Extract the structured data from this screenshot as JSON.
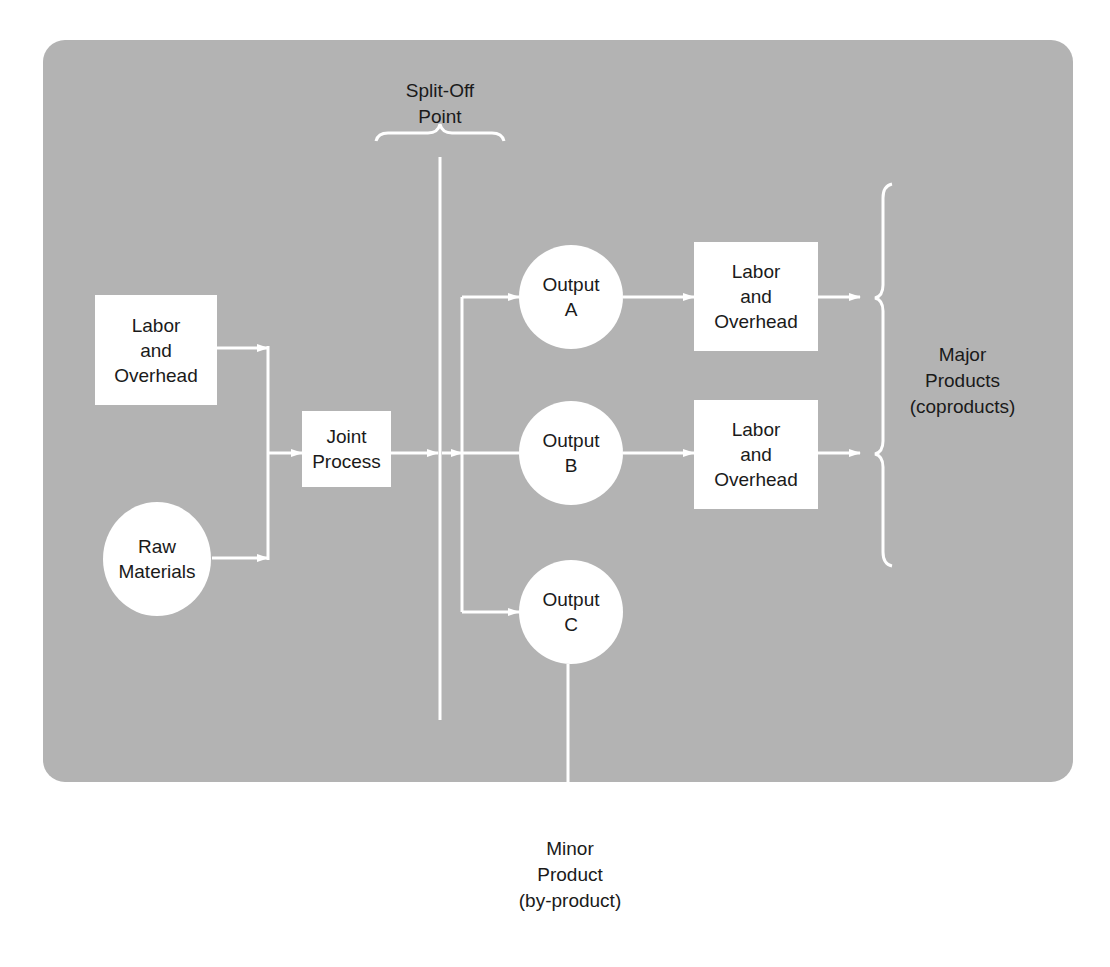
{
  "figure": {
    "colors": {
      "panel": "#b3b3b3",
      "node_fill": "#ffffff",
      "line": "#ffffff",
      "text": "#1a1a1a"
    }
  },
  "nodes": {
    "labor_overhead_input": {
      "shape": "rectangle",
      "lines": [
        "Labor",
        "and",
        "Overhead"
      ]
    },
    "raw_materials": {
      "shape": "circle",
      "lines": [
        "Raw",
        "Materials"
      ]
    },
    "joint_process": {
      "shape": "rectangle",
      "lines": [
        "Joint",
        "Process"
      ]
    },
    "output_a": {
      "shape": "circle",
      "lines": [
        "Output",
        "A"
      ]
    },
    "output_b": {
      "shape": "circle",
      "lines": [
        "Output",
        "B"
      ]
    },
    "output_c": {
      "shape": "circle",
      "lines": [
        "Output",
        "C"
      ]
    },
    "labor_overhead_a": {
      "shape": "rectangle",
      "lines": [
        "Labor",
        "and",
        "Overhead"
      ]
    },
    "labor_overhead_b": {
      "shape": "rectangle",
      "lines": [
        "Labor",
        "and",
        "Overhead"
      ]
    }
  },
  "annotations": {
    "split_off_point": {
      "lines": [
        "Split-Off",
        "Point"
      ]
    },
    "major_products": {
      "lines": [
        "Major",
        "Products",
        "(coproducts)"
      ]
    },
    "minor_product": {
      "lines": [
        "Minor",
        "Product",
        "(by-product)"
      ]
    }
  },
  "edges": [
    {
      "from": "labor_overhead_input",
      "to": "joint_process"
    },
    {
      "from": "raw_materials",
      "to": "joint_process"
    },
    {
      "from": "joint_process",
      "to": "output_a"
    },
    {
      "from": "joint_process",
      "to": "output_b"
    },
    {
      "from": "joint_process",
      "to": "output_c"
    },
    {
      "from": "output_a",
      "to": "labor_overhead_a"
    },
    {
      "from": "output_b",
      "to": "labor_overhead_b"
    },
    {
      "from": "labor_overhead_a",
      "to": "major_products"
    },
    {
      "from": "labor_overhead_b",
      "to": "major_products"
    },
    {
      "from": "output_c",
      "to": "minor_product"
    }
  ]
}
